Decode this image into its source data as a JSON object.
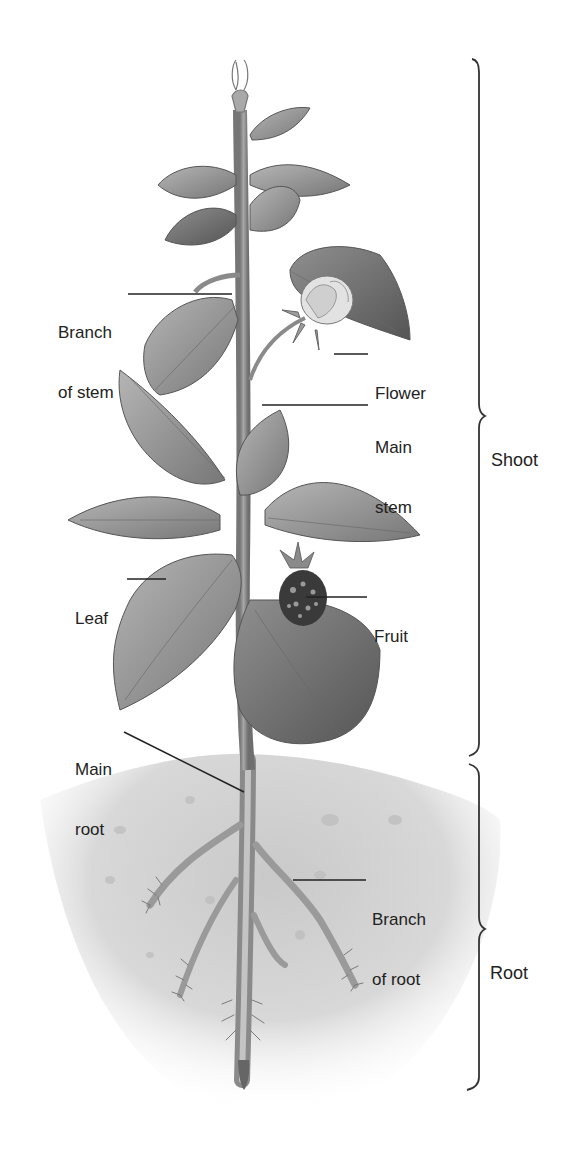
{
  "diagram": {
    "style": "grayscale pencil illustration",
    "colors": {
      "background": "#ffffff",
      "ink": "#222222",
      "leaf_fill": "#9a9a9a",
      "leaf_dark": "#6e6e6e",
      "stem": "#8c8c8c",
      "soil": "#d2d2d2",
      "fruit": "#3a3a3a"
    },
    "callouts": [
      {
        "id": "branch-of-stem",
        "line1": "Branch",
        "line2": "of stem"
      },
      {
        "id": "flower",
        "line1": "Flower",
        "line2": ""
      },
      {
        "id": "main-stem",
        "line1": "Main",
        "line2": "stem"
      },
      {
        "id": "leaf",
        "line1": "Leaf",
        "line2": ""
      },
      {
        "id": "fruit",
        "line1": "Fruit",
        "line2": ""
      },
      {
        "id": "main-root",
        "line1": "Main",
        "line2": "root"
      },
      {
        "id": "branch-of-root",
        "line1": "Branch",
        "line2": "of root"
      }
    ],
    "brackets": [
      {
        "id": "shoot",
        "label": "Shoot"
      },
      {
        "id": "root",
        "label": "Root"
      }
    ]
  }
}
